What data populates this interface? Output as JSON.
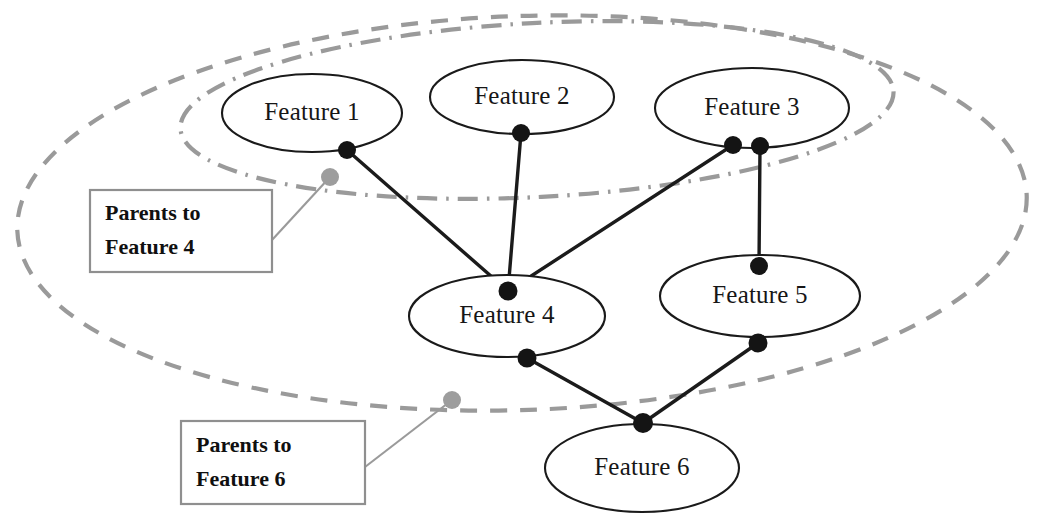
{
  "diagram": {
    "type": "node-link-diagram",
    "canvas": {
      "width": 1040,
      "height": 525,
      "background": "#ffffff"
    },
    "colors": {
      "node_stroke": "#1a1a1a",
      "node_fill": "#ffffff",
      "node_text": "#161616",
      "edge": "#1b1b1b",
      "edge_dot": "#141414",
      "boundary": "#9a9a9a",
      "anchor_dot": "#9d9d9d",
      "callout_border": "#8f8f8f",
      "callout_text": "#101010"
    },
    "nodes": [
      {
        "id": "f1",
        "label": "Feature 1",
        "cx": 312,
        "cy": 113,
        "rx": 90,
        "ry": 39
      },
      {
        "id": "f2",
        "label": "Feature 2",
        "cx": 522,
        "cy": 97,
        "rx": 92,
        "ry": 37
      },
      {
        "id": "f3",
        "label": "Feature 3",
        "cx": 752,
        "cy": 108,
        "rx": 97,
        "ry": 40
      },
      {
        "id": "f4",
        "label": "Feature 4",
        "cx": 507,
        "cy": 316,
        "rx": 98,
        "ry": 41
      },
      {
        "id": "f5",
        "label": "Feature 5",
        "cx": 760,
        "cy": 296,
        "rx": 100,
        "ry": 41
      },
      {
        "id": "f6",
        "label": "Feature 6",
        "cx": 642,
        "cy": 468,
        "rx": 97,
        "ry": 44
      }
    ],
    "edges": [
      {
        "id": "e1",
        "from": "f1",
        "to": "f4",
        "x1": 347,
        "y1": 150,
        "x2": 508,
        "y2": 291
      },
      {
        "id": "e2",
        "from": "f2",
        "to": "f4",
        "x1": 521,
        "y1": 133,
        "x2": 508,
        "y2": 291
      },
      {
        "id": "e3",
        "from": "f3",
        "to": "f4",
        "x1": 733,
        "y1": 145,
        "x2": 508,
        "y2": 291
      },
      {
        "id": "e4",
        "from": "f3",
        "to": "f5",
        "x1": 760,
        "y1": 146,
        "x2": 759,
        "y2": 266
      },
      {
        "id": "e5",
        "from": "f4",
        "to": "f6",
        "x1": 527,
        "y1": 358,
        "x2": 643,
        "y2": 423
      },
      {
        "id": "e6",
        "from": "f5",
        "to": "f6",
        "x1": 758,
        "y1": 343,
        "x2": 643,
        "y2": 423
      }
    ],
    "edge_dots": [
      {
        "id": "d-f1-bottom",
        "node": "f1",
        "cx": 347,
        "cy": 150,
        "r": 9
      },
      {
        "id": "d-f2-bottom",
        "node": "f2",
        "cx": 521,
        "cy": 133,
        "r": 9
      },
      {
        "id": "d-f3-bottom-left",
        "node": "f3",
        "cx": 733,
        "cy": 145,
        "r": 9
      },
      {
        "id": "d-f3-bottom-right",
        "node": "f3",
        "cx": 760,
        "cy": 146,
        "r": 9
      },
      {
        "id": "d-f4-top",
        "node": "f4",
        "cx": 508,
        "cy": 291,
        "r": 9.5
      },
      {
        "id": "d-f4-bottom",
        "node": "f4",
        "cx": 527,
        "cy": 358,
        "r": 9.5
      },
      {
        "id": "d-f5-top",
        "node": "f5",
        "cx": 759,
        "cy": 266,
        "r": 9
      },
      {
        "id": "d-f5-bottom",
        "node": "f5",
        "cx": 758,
        "cy": 343,
        "r": 9.5
      },
      {
        "id": "d-f6-top",
        "node": "f6",
        "cx": 643,
        "cy": 423,
        "r": 10
      }
    ],
    "boundaries": [
      {
        "id": "parents-to-feature-6-boundary",
        "style": "dashed",
        "label_ref": "Parents to Feature 6",
        "cx": 522,
        "cy": 213,
        "rx": 505,
        "ry": 197,
        "rotate": -2
      },
      {
        "id": "parents-to-feature-4-boundary",
        "style": "dash-dot",
        "label_ref": "Parents to Feature 4",
        "cx": 537,
        "cy": 110,
        "rx": 357,
        "ry": 87,
        "rotate": -3
      }
    ],
    "callouts": [
      {
        "id": "callout-feature-4",
        "line1": "Parents to",
        "line2": "Feature 4",
        "box": {
          "x": 90,
          "y": 190,
          "width": 182,
          "height": 82
        },
        "anchor_dot": {
          "cx": 330,
          "cy": 177,
          "r": 9
        },
        "leader": {
          "x1": 272,
          "y1": 240,
          "x2": 330,
          "y2": 177
        }
      },
      {
        "id": "callout-feature-6",
        "line1": "Parents to",
        "line2": "Feature 6",
        "box": {
          "x": 181,
          "y": 421,
          "width": 184,
          "height": 83
        },
        "anchor_dot": {
          "cx": 452,
          "cy": 400,
          "r": 9
        },
        "leader": {
          "x1": 365,
          "y1": 467,
          "x2": 452,
          "y2": 400
        }
      }
    ]
  }
}
